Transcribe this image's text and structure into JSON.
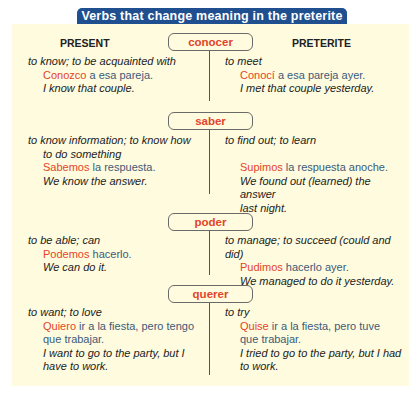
{
  "title": "Verbs that change meaning in the preterite",
  "columns": {
    "present": "PRESENT",
    "preterite": "PRETERITE"
  },
  "verbs": [
    {
      "name": "conocer",
      "present": {
        "def": "to know; to be acquainted with",
        "def2": "",
        "verb": "Conozco",
        "rest": " a esa pareja.",
        "rest2": "",
        "en": "I know that couple.",
        "en2": ""
      },
      "preterite": {
        "def": "to meet",
        "verb": "Conocí",
        "rest": " a esa pareja ayer.",
        "rest2": "",
        "en": "I met that couple yesterday.",
        "en2": ""
      }
    },
    {
      "name": "saber",
      "present": {
        "def": "to know information; to know how",
        "def2": "to do something",
        "verb": "Sabemos",
        "rest": " la respuesta.",
        "rest2": "",
        "en": "We know the answer.",
        "en2": ""
      },
      "preterite": {
        "def": "to find out; to learn",
        "verb": "Supimos",
        "rest": " la respuesta anoche.",
        "rest2": "",
        "en": "We found out (learned) the answer",
        "en2": "last night."
      }
    },
    {
      "name": "poder",
      "present": {
        "def": "to be able; can",
        "def2": "",
        "verb": "Podemos",
        "rest": " hacerlo.",
        "rest2": "",
        "en": "We can do it.",
        "en2": ""
      },
      "preterite": {
        "def": "to manage; to succeed (could and did)",
        "verb": "Pudimos",
        "rest": " hacerlo ayer.",
        "rest2": "",
        "en": "We managed to do it yesterday.",
        "en2": ""
      }
    },
    {
      "name": "querer",
      "present": {
        "def": "to want; to love",
        "def2": "",
        "verb": "Quiero",
        "rest": " ir a la fiesta, pero tengo",
        "rest2": "que trabajar.",
        "en": "I want to go to the party, but I",
        "en2": "have to work."
      },
      "preterite": {
        "def": "to try",
        "verb": "Quise",
        "rest": " ir a la fiesta, pero tuve",
        "rest2": "que trabajar.",
        "en": "I tried to go to the party, but I had",
        "en2": "to work."
      }
    }
  ]
}
